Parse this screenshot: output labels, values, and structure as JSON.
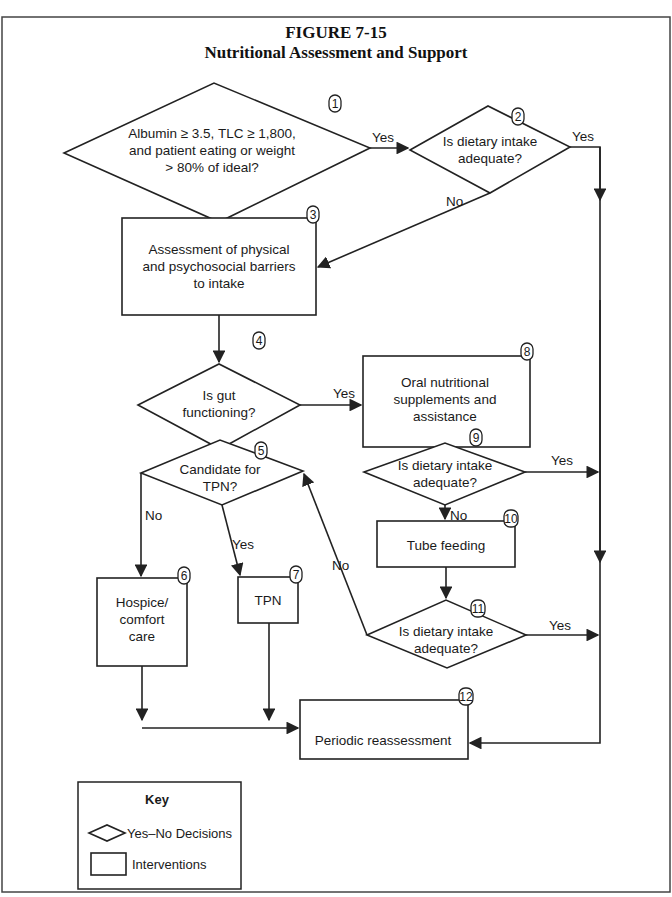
{
  "figure": {
    "label": "FIGURE 7-15",
    "title": "Nutritional Assessment and Support"
  },
  "nodes": {
    "n1": {
      "number": "1",
      "type": "decision",
      "lines": [
        "Albumin ≥ 3.5, TLC ≥ 1,800,",
        "and patient eating or weight",
        "> 80% of ideal?"
      ]
    },
    "n2": {
      "number": "2",
      "type": "decision",
      "lines": [
        "Is dietary intake",
        "adequate?"
      ]
    },
    "n3": {
      "number": "3",
      "type": "intervention",
      "lines": [
        "Assessment of physical",
        "and psychosocial barriers",
        "to intake"
      ]
    },
    "n4": {
      "number": "4",
      "type": "decision",
      "lines": [
        "Is gut",
        "functioning?"
      ]
    },
    "n5": {
      "number": "5",
      "type": "decision",
      "lines": [
        "Candidate for",
        "TPN?"
      ]
    },
    "n6": {
      "number": "6",
      "type": "intervention",
      "lines": [
        "Hospice/",
        "comfort",
        "care"
      ]
    },
    "n7": {
      "number": "7",
      "type": "intervention",
      "lines": [
        "TPN"
      ]
    },
    "n8": {
      "number": "8",
      "type": "intervention",
      "lines": [
        "Oral nutritional",
        "supplements and",
        "assistance"
      ]
    },
    "n9": {
      "number": "9",
      "type": "decision",
      "lines": [
        "Is dietary intake",
        "adequate?"
      ]
    },
    "n10": {
      "number": "10",
      "type": "intervention",
      "lines": [
        "Tube feeding"
      ]
    },
    "n11": {
      "number": "11",
      "type": "decision",
      "lines": [
        "Is dietary intake",
        "adequate?"
      ]
    },
    "n12": {
      "number": "12",
      "type": "intervention",
      "lines": [
        "Periodic reassessment"
      ]
    }
  },
  "edges": {
    "e1_2": {
      "from": "1",
      "to": "2",
      "label": "Yes"
    },
    "e1_3": {
      "from": "1",
      "to": "3",
      "label": "No"
    },
    "e2_12": {
      "from": "2",
      "to": "12",
      "label": "Yes"
    },
    "e2_3": {
      "from": "2",
      "to": "3",
      "label": "No"
    },
    "e3_4": {
      "from": "3",
      "to": "4",
      "label": ""
    },
    "e4_8": {
      "from": "4",
      "to": "8",
      "label": "Yes"
    },
    "e4_5": {
      "from": "4",
      "to": "5",
      "label": "No"
    },
    "e5_6": {
      "from": "5",
      "to": "6",
      "label": "No"
    },
    "e5_7": {
      "from": "5",
      "to": "7",
      "label": "Yes"
    },
    "e8_9": {
      "from": "8",
      "to": "9",
      "label": ""
    },
    "e9_12": {
      "from": "9",
      "to": "12",
      "label": "Yes"
    },
    "e9_10": {
      "from": "9",
      "to": "10",
      "label": "No"
    },
    "e10_11": {
      "from": "10",
      "to": "11",
      "label": ""
    },
    "e11_12": {
      "from": "11",
      "to": "12",
      "label": "Yes"
    },
    "e11_5": {
      "from": "11",
      "to": "5",
      "label": "No"
    },
    "e6_12": {
      "from": "6",
      "to": "12",
      "label": ""
    },
    "e7_12": {
      "from": "7",
      "to": "12",
      "label": ""
    }
  },
  "key": {
    "title": "Key",
    "decision_label": "Yes–No Decisions",
    "intervention_label": "Interventions"
  },
  "note": {
    "prefix": "Note",
    "text": ":  TLC = total lymphocyte count; TPN = total parenteral nutrition."
  }
}
